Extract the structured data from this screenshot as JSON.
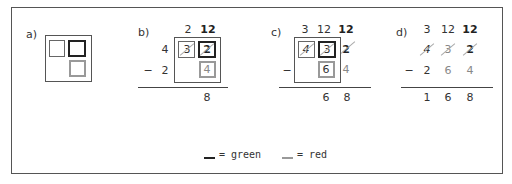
{
  "panels": {
    "a": {
      "label": "a)"
    },
    "b": {
      "label": "b)",
      "carry_row": [
        "2",
        "12"
      ],
      "minuend": [
        "4",
        "3",
        "2"
      ],
      "subtrahend_sign": "−",
      "subtrahend": [
        "2",
        "",
        "4"
      ],
      "result": [
        "",
        "",
        "8"
      ]
    },
    "c": {
      "label": "c)",
      "carry_row": [
        "3",
        "12",
        "12"
      ],
      "minuend": [
        "4",
        "3",
        "2"
      ],
      "subtrahend_sign": "−",
      "subtrahend": [
        "",
        "6",
        "4"
      ],
      "result": [
        "",
        "6",
        "8"
      ]
    },
    "d": {
      "label": "d)",
      "carry_row": [
        "3",
        "12",
        "12"
      ],
      "minuend": [
        "4",
        "3",
        "2"
      ],
      "subtrahend_sign": "−",
      "subtrahend": [
        "2",
        "6",
        "4"
      ],
      "result": [
        "1",
        "6",
        "8"
      ]
    }
  },
  "legend": {
    "green_label": "= green",
    "red_label": "= red",
    "colors": {
      "green": "#222222",
      "red": "#999999"
    }
  }
}
